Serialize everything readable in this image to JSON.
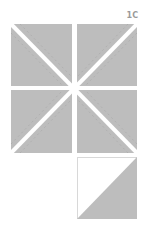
{
  "diagram": {
    "label": "1C",
    "colors": {
      "fabric": "#bdbdbd",
      "background": "#ffffff",
      "seam_line": "#a4a4a4",
      "label": "#9a9a9a",
      "outline": "#d6d6d6"
    },
    "grid_squares": [
      {
        "id": "top-left",
        "x": 11,
        "y": 24,
        "w": 61,
        "h": 62
      },
      {
        "id": "top-right",
        "x": 77,
        "y": 24,
        "w": 60,
        "h": 62
      },
      {
        "id": "bottom-left",
        "x": 11,
        "y": 90,
        "w": 61,
        "h": 63
      },
      {
        "id": "bottom-right",
        "x": 77,
        "y": 90,
        "w": 60,
        "h": 63
      }
    ],
    "half_square_triangle": {
      "x": 77,
      "y": 157,
      "w": 60,
      "h": 62,
      "light_half": "upper-left",
      "dark_half": "lower-right"
    }
  }
}
